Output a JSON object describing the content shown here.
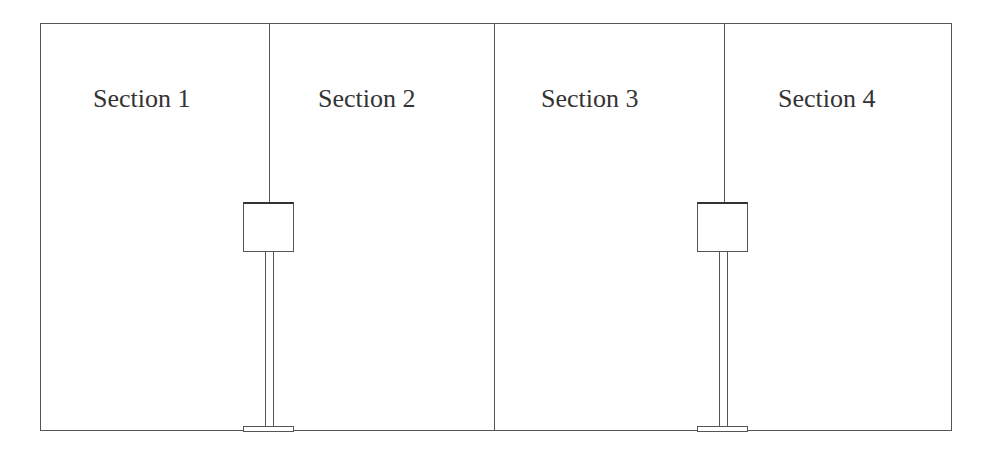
{
  "diagram": {
    "sections": [
      {
        "label": "Section 1"
      },
      {
        "label": "Section 2"
      },
      {
        "label": "Section 3"
      },
      {
        "label": "Section 4"
      }
    ],
    "colors": {
      "line": "#555555",
      "text": "#333333",
      "background": "#ffffff"
    }
  }
}
